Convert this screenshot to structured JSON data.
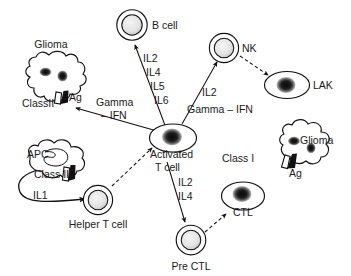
{
  "diagram": {
    "type": "biological-pathway-diagram",
    "stroke_color": "#111111",
    "background_color": "#ffffff",
    "nucleus_dark_color": "#111111",
    "nucleus_light_color": "#e6e6e6"
  },
  "cells": [
    {
      "id": "glioma-left",
      "label": "Glioma",
      "shape": "amoeboid",
      "nucleus": "dark-two"
    },
    {
      "id": "b-cell",
      "label": "B cell",
      "shape": "double-circle",
      "nucleus": "light"
    },
    {
      "id": "nk",
      "label": "NK",
      "shape": "double-circle",
      "nucleus": "light"
    },
    {
      "id": "lak",
      "label": "LAK",
      "shape": "ellipse",
      "nucleus": "dark"
    },
    {
      "id": "activated-t",
      "label": "Activated\nT cell",
      "shape": "ellipse",
      "nucleus": "dark"
    },
    {
      "id": "apc",
      "label": "APC",
      "shape": "amoeboid-kidney",
      "nucleus": "kidney"
    },
    {
      "id": "helper-t",
      "label": "Helper T cell",
      "shape": "double-circle",
      "nucleus": "light"
    },
    {
      "id": "pre-ctl",
      "label": "Pre CTL",
      "shape": "double-circle",
      "nucleus": "light"
    },
    {
      "id": "ctl",
      "label": "CTL",
      "shape": "ellipse",
      "nucleus": "dark"
    },
    {
      "id": "glioma-right",
      "label": "Glioma",
      "shape": "amoeboid",
      "nucleus": "dark-two"
    }
  ],
  "markers": [
    {
      "id": "classII-left",
      "label": "ClassII",
      "on": "glioma-left"
    },
    {
      "id": "ag-left",
      "label": "Ag",
      "on": "glioma-left"
    },
    {
      "id": "classII-apc",
      "label": "Class II",
      "on": "apc"
    },
    {
      "id": "classI-right",
      "label": "Class I",
      "on": "glioma-right"
    },
    {
      "id": "ag-right",
      "label": "Ag",
      "on": "glioma-right"
    }
  ],
  "arrows": [
    {
      "id": "act-to-bcell",
      "from": "activated-t",
      "to": "b-cell",
      "style": "solid",
      "labels": [
        "IL2",
        "IL4",
        "IL5",
        "IL6"
      ]
    },
    {
      "id": "act-to-nk",
      "from": "activated-t",
      "to": "nk",
      "style": "solid",
      "labels": [
        "IL2"
      ]
    },
    {
      "id": "nk-to-lak",
      "from": "nk",
      "to": "lak",
      "style": "dashed",
      "labels": []
    },
    {
      "id": "act-to-glioma-l",
      "from": "activated-t",
      "to": "glioma-left",
      "style": "solid",
      "labels": [
        "Gamma",
        "– IFN"
      ]
    },
    {
      "id": "act-gamma-right",
      "from": "activated-t",
      "to": "nk-region",
      "style": "label",
      "labels": [
        "Gamma – IFN"
      ]
    },
    {
      "id": "helper-to-act",
      "from": "helper-t",
      "to": "activated-t",
      "style": "dashed",
      "labels": []
    },
    {
      "id": "apc-to-helper",
      "from": "apc",
      "to": "helper-t",
      "style": "curved",
      "labels": [
        "IL1"
      ]
    },
    {
      "id": "act-to-prectl",
      "from": "activated-t",
      "to": "pre-ctl",
      "style": "solid",
      "labels": [
        "IL2",
        "IL4"
      ]
    },
    {
      "id": "prectl-to-ctl",
      "from": "pre-ctl",
      "to": "ctl",
      "style": "dashed",
      "labels": []
    }
  ],
  "labels": {
    "glioma_left": "Glioma",
    "class2_left": "ClassII",
    "ag_left": "Ag",
    "b_cell": "B cell",
    "il2_b": "IL2",
    "il4_b": "IL4",
    "il5_b": "IL5",
    "il6_b": "IL6",
    "gamma_left_1": "Gamma",
    "gamma_left_2": "– IFN",
    "nk": "NK",
    "il2_nk": "IL2",
    "gamma_right": "Gamma – IFN",
    "lak": "LAK",
    "activated_1": "Activated",
    "activated_2": "T cell",
    "apc": "APC",
    "class2_apc": "Class II",
    "il1": "IL1",
    "helper_t": "Helper T cell",
    "il2_pre": "IL2",
    "il4_pre": "IL4",
    "pre_ctl": "Pre CTL",
    "ctl": "CTL",
    "class1_right": "Class I",
    "ag_right": "Ag",
    "glioma_right": "Glioma"
  }
}
